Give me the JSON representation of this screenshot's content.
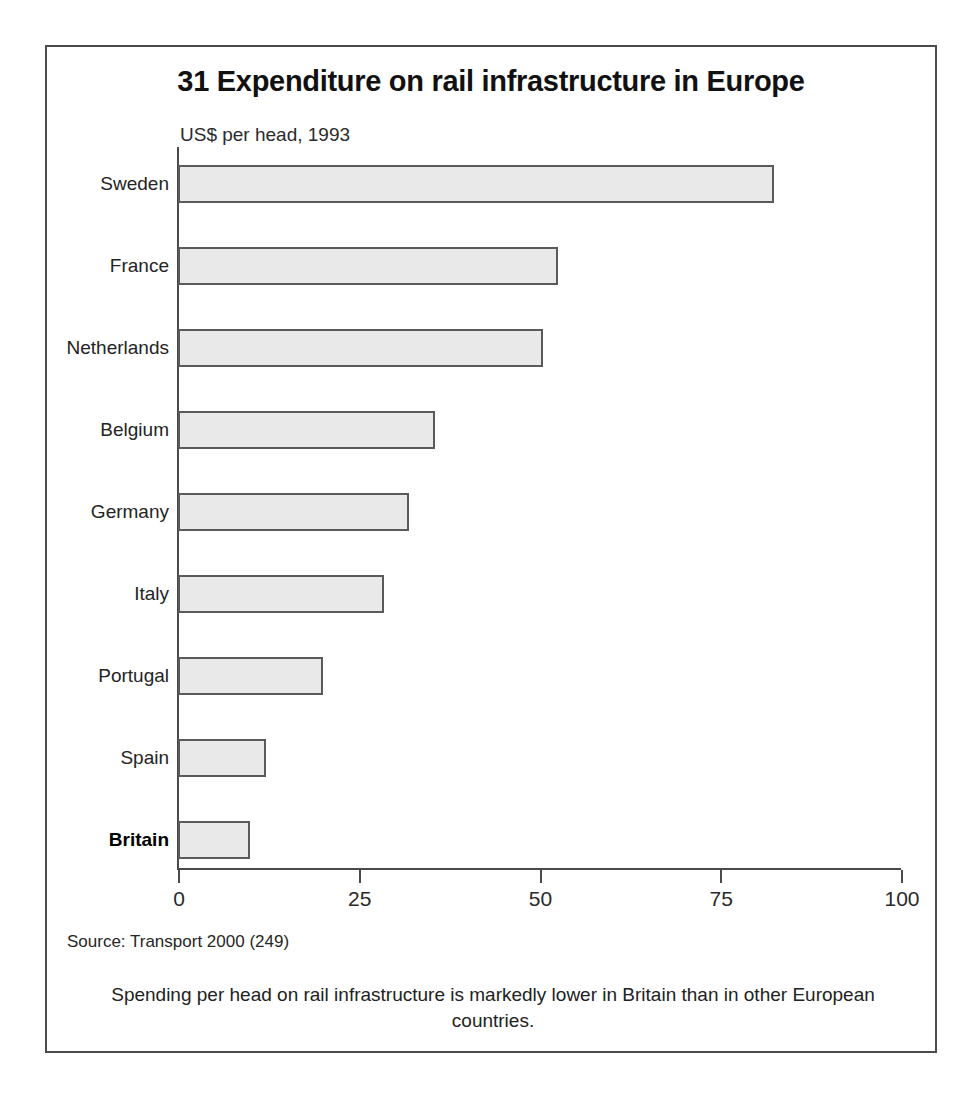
{
  "figure": {
    "title": "31 Expenditure on rail infrastructure in Europe",
    "axis_unit_label": "US$ per head, 1993",
    "source": "Source: Transport 2000 (249)",
    "caption": "Spending per head on rail infrastructure is markedly lower in Britain than in other European countries.",
    "frame_color": "#4c4c4c",
    "bar_fill_color": "#e9e9e9",
    "bar_border_color": "#5a5a5a",
    "axis_color": "#4a4a4a"
  },
  "chart_data": {
    "type": "bar",
    "orientation": "horizontal",
    "title": "31 Expenditure on rail infrastructure in Europe",
    "subtitle": "US$ per head, 1993",
    "xlabel": "",
    "ylabel": "",
    "xlim": [
      0,
      100
    ],
    "grid": false,
    "legend": false,
    "xticks": [
      0,
      25,
      50,
      75,
      100
    ],
    "xtick_labels": [
      "0",
      "25",
      "50",
      "75",
      "100"
    ],
    "categories": [
      "Sweden",
      "France",
      "Netherlands",
      "Belgium",
      "Germany",
      "Italy",
      "Portugal",
      "Spain",
      "Britain"
    ],
    "values": [
      82.5,
      52.5,
      50.5,
      35.5,
      32,
      28.5,
      20,
      12.2,
      10
    ],
    "highlight_category": "Britain",
    "bars": [
      {
        "label": "Sweden",
        "value": 82.5,
        "highlight": false
      },
      {
        "label": "France",
        "value": 52.5,
        "highlight": false
      },
      {
        "label": "Netherlands",
        "value": 50.5,
        "highlight": false
      },
      {
        "label": "Belgium",
        "value": 35.5,
        "highlight": false
      },
      {
        "label": "Germany",
        "value": 32.0,
        "highlight": false
      },
      {
        "label": "Italy",
        "value": 28.5,
        "highlight": false
      },
      {
        "label": "Portugal",
        "value": 20.0,
        "highlight": false
      },
      {
        "label": "Spain",
        "value": 12.2,
        "highlight": false
      },
      {
        "label": "Britain",
        "value": 10.0,
        "highlight": true
      }
    ]
  }
}
